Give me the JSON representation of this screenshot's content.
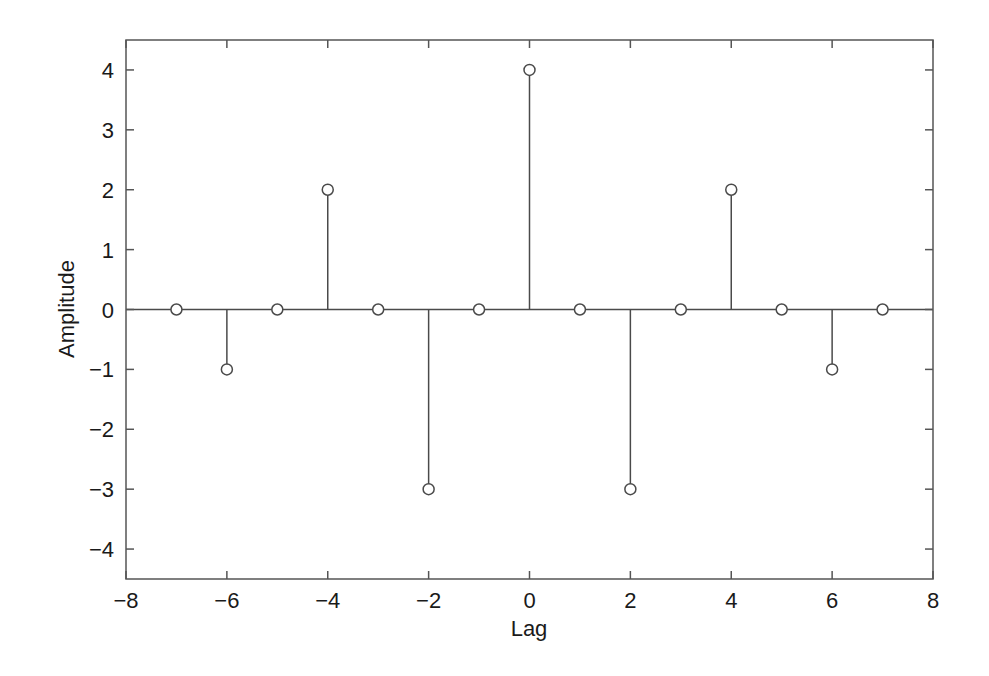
{
  "chart_data": {
    "type": "stem",
    "title": "",
    "xlabel": "Lag",
    "ylabel": "Amplitude",
    "xlim": [
      -8,
      8
    ],
    "ylim": [
      -4.5,
      4.5
    ],
    "xticks": [
      -8,
      -6,
      -4,
      -2,
      0,
      2,
      4,
      6,
      8
    ],
    "yticks": [
      -4,
      -3,
      -2,
      -1,
      0,
      1,
      2,
      3,
      4
    ],
    "grid": false,
    "legend": null,
    "baseline": 0,
    "marker": "open-circle",
    "x": [
      -7,
      -6,
      -5,
      -4,
      -3,
      -2,
      -1,
      0,
      1,
      2,
      3,
      4,
      5,
      6,
      7
    ],
    "values": [
      0,
      -1,
      0,
      2,
      0,
      -3,
      0,
      4,
      0,
      -3,
      0,
      2,
      0,
      -1,
      0
    ]
  },
  "colors": {
    "axes": "#555555",
    "stem": "#4a4a4a",
    "text": "#1a1a1a",
    "background": "#ffffff"
  },
  "tick_labels": {
    "x": [
      "−8",
      "−6",
      "−4",
      "−2",
      "0",
      "2",
      "4",
      "6",
      "8"
    ],
    "y": [
      "−4",
      "−3",
      "−2",
      "−1",
      "0",
      "1",
      "2",
      "3",
      "4"
    ]
  }
}
